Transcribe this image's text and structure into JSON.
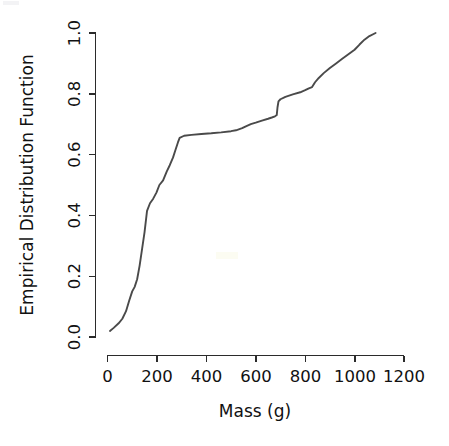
{
  "chart_data": {
    "type": "line",
    "title": "",
    "subtitle": "",
    "xlabel": "Mass (g)",
    "ylabel": "Empirical Distribution Function",
    "xlim": [
      0,
      1200
    ],
    "ylim": [
      0.0,
      1.0
    ],
    "xticks": [
      0,
      200,
      400,
      600,
      800,
      1000,
      1200
    ],
    "xtick_labels": [
      "0",
      "200",
      "400",
      "600",
      "800",
      "1000",
      "1200"
    ],
    "yticks": [
      0.0,
      0.2,
      0.4,
      0.6,
      0.8,
      1.0
    ],
    "ytick_labels": [
      "0.0",
      "0.2",
      "0.4",
      "0.6",
      "0.8",
      "1.0"
    ],
    "grid": false,
    "legend": false,
    "legend_position": "none",
    "line_color": "#4a4a4a",
    "axis_color": "#2b2b2b",
    "background_color": "#ffffff",
    "series": [
      {
        "name": "Empirical Distribution Function",
        "x": [
          10,
          25,
          45,
          60,
          75,
          88,
          100,
          110,
          120,
          130,
          140,
          150,
          160,
          172,
          185,
          198,
          210,
          225,
          240,
          252,
          265,
          275,
          285,
          292,
          310,
          340,
          380,
          420,
          460,
          500,
          520,
          545,
          560,
          580,
          600,
          625,
          650,
          665,
          678,
          685,
          688,
          692,
          700,
          720,
          750,
          780,
          800,
          815,
          828,
          840,
          855,
          875,
          900,
          925,
          950,
          975,
          1000,
          1020,
          1040,
          1060,
          1085
        ],
        "y": [
          0.02,
          0.03,
          0.045,
          0.06,
          0.085,
          0.12,
          0.15,
          0.165,
          0.19,
          0.235,
          0.29,
          0.345,
          0.415,
          0.44,
          0.455,
          0.475,
          0.5,
          0.515,
          0.545,
          0.565,
          0.59,
          0.615,
          0.64,
          0.655,
          0.662,
          0.665,
          0.668,
          0.67,
          0.673,
          0.677,
          0.68,
          0.687,
          0.693,
          0.7,
          0.705,
          0.712,
          0.718,
          0.722,
          0.726,
          0.73,
          0.755,
          0.775,
          0.782,
          0.79,
          0.798,
          0.805,
          0.812,
          0.818,
          0.822,
          0.838,
          0.852,
          0.868,
          0.885,
          0.9,
          0.915,
          0.93,
          0.945,
          0.962,
          0.978,
          0.99,
          1.0
        ]
      }
    ]
  }
}
